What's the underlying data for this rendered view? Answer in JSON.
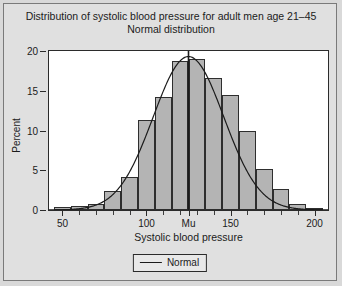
{
  "figure": {
    "title_line1": "Distribution of systolic blood pressure for adult men age 21–45",
    "title_line2": "Normal distribution"
  },
  "legend": {
    "entries": [
      {
        "label": "Normal",
        "marker": "line",
        "color": "#1b1b1b"
      }
    ]
  },
  "chart_data": {
    "type": "bar",
    "title": "Distribution of systolic blood pressure for adult men age 21–45",
    "subtitle": "Normal distribution",
    "xlabel": "Systolic blood pressure",
    "ylabel": "Percent",
    "xlim": [
      42,
      208
    ],
    "ylim": [
      0,
      20
    ],
    "yticks": [
      0,
      5,
      10,
      15,
      20
    ],
    "ytick_labels": [
      "0",
      "5",
      "10",
      "15",
      "20"
    ],
    "xticks": [
      50,
      100,
      125,
      150,
      200
    ],
    "xtick_labels": [
      "50",
      "100",
      "Mu",
      "150",
      "200"
    ],
    "xticks_minor": [
      60,
      70,
      80,
      90,
      110,
      120,
      130,
      140,
      160,
      170,
      180,
      190
    ],
    "grid": false,
    "legend_position": "below-axis",
    "bin_width": 10,
    "bin_starts": [
      45,
      55,
      65,
      75,
      85,
      95,
      105,
      115,
      125,
      135,
      145,
      155,
      165,
      175,
      185,
      195
    ],
    "bin_centers": [
      50,
      60,
      70,
      80,
      90,
      100,
      110,
      120,
      130,
      140,
      150,
      160,
      170,
      180,
      190,
      200
    ],
    "values": [
      0.4,
      0.5,
      0.8,
      2.4,
      4.2,
      11.3,
      14.2,
      18.7,
      19.0,
      16.6,
      14.5,
      10.0,
      5.1,
      2.6,
      0.8,
      0.3
    ],
    "bar_fill": "#b4b4b4",
    "bar_edge": "#2e2e2e",
    "annotations": [
      {
        "type": "vline",
        "x": 125,
        "label": "Mu",
        "color": "#1b1b1b"
      }
    ],
    "series": [
      {
        "name": "Normal",
        "type": "line",
        "color": "#1b1b1b",
        "mean": 125,
        "std": 21,
        "peak_percent": 19.3,
        "x": [
          42,
          50,
          60,
          70,
          80,
          90,
          100,
          110,
          120,
          125,
          130,
          140,
          150,
          160,
          170,
          180,
          190,
          200,
          208
        ],
        "y": [
          0.1,
          0.3,
          0.8,
          1.8,
          3.6,
          6.4,
          10.2,
          14.5,
          18.1,
          19.3,
          18.1,
          14.5,
          10.2,
          6.4,
          3.6,
          1.8,
          0.8,
          0.3,
          0.1
        ]
      }
    ]
  }
}
